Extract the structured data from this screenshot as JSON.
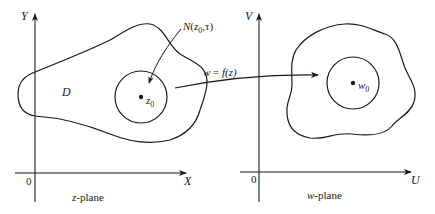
{
  "diagram": {
    "colors": {
      "stroke": "#1a1a1a",
      "background": "#ffffff"
    },
    "z_plane": {
      "caption_var": "z",
      "caption_rest": "-plane",
      "x_axis_label": "X",
      "y_axis_label": "Y",
      "origin_label": "0",
      "region_label": "D",
      "point_label": "z",
      "point_sub": "0",
      "neighborhood_label": {
        "prefix": "N(",
        "var": "z",
        "sub": "0",
        "suffix": ",τ)"
      }
    },
    "w_plane": {
      "caption_var": "w",
      "caption_rest": "-plane",
      "x_axis_label": "U",
      "y_axis_label": "V",
      "origin_label": "0",
      "point_label": "w",
      "point_sub": "0"
    },
    "mapping": {
      "lhs": "w",
      "eq": " = ",
      "rhs": "f(z)"
    }
  }
}
